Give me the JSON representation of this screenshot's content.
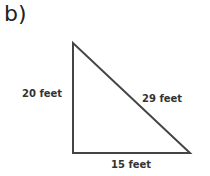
{
  "problem_label": "b)",
  "triangle": {
    "left_side": "20 feet",
    "hypotenuse": "29 feet",
    "bottom_side": "15 feet"
  }
}
